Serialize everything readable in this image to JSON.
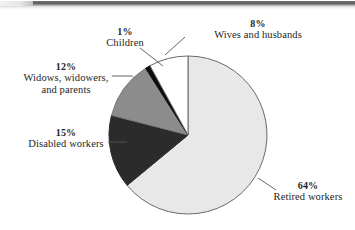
{
  "figure": {
    "type": "pie-chart-scan",
    "background_color": "#ffffff",
    "text_color": "#1e1e1e"
  },
  "scan_artifact": {
    "name": "top-edge-scan-bar",
    "color": "#5b5b5b"
  },
  "chart_data": {
    "type": "pie",
    "title": "",
    "xlabel": "",
    "ylabel": "",
    "legend_position": "callout-labels",
    "grid": false,
    "start_angle_deg": 0,
    "direction": "clockwise",
    "categories": [
      "Retired workers",
      "Disabled workers",
      "Widows, widowers, and parents",
      "Children",
      "Wives and husbands"
    ],
    "values": [
      64,
      15,
      12,
      1,
      8
    ],
    "value_labels": [
      "64%",
      "15%",
      "12%",
      "1%",
      "8%"
    ],
    "colors": [
      "#e8e8e8",
      "#2b2b2b",
      "#8c8c8c",
      "#0d0d0d",
      "#ffffff"
    ],
    "slices": [
      {
        "label": "Retired workers",
        "percent_label": "64%",
        "value": 64,
        "color": "#e8e8e8",
        "stroke": "#6a6a6a"
      },
      {
        "label": "Disabled workers",
        "percent_label": "15%",
        "value": 15,
        "color": "#2b2b2b",
        "stroke": "#2b2b2b"
      },
      {
        "label": "Widows, widowers,",
        "label_line2": "and parents",
        "percent_label": "12%",
        "value": 12,
        "color": "#8c8c8c",
        "stroke": "#7a7a7a"
      },
      {
        "label": "Children",
        "percent_label": "1%",
        "value": 1,
        "color": "#0d0d0d",
        "stroke": "#0d0d0d"
      },
      {
        "label": "Wives and husbands",
        "percent_label": "8%",
        "value": 8,
        "color": "#ffffff",
        "stroke": "#6a6a6a"
      }
    ]
  },
  "labels": {
    "wives": {
      "pct": "8%",
      "cat": "Wives and husbands"
    },
    "children": {
      "pct": "1%",
      "cat": "Children"
    },
    "widows": {
      "pct": "12%",
      "cat_line1": "Widows, widowers,",
      "cat_line2": "and parents"
    },
    "disabled": {
      "pct": "15%",
      "cat": "Disabled workers"
    },
    "retired": {
      "pct": "64%",
      "cat": "Retired workers"
    }
  }
}
